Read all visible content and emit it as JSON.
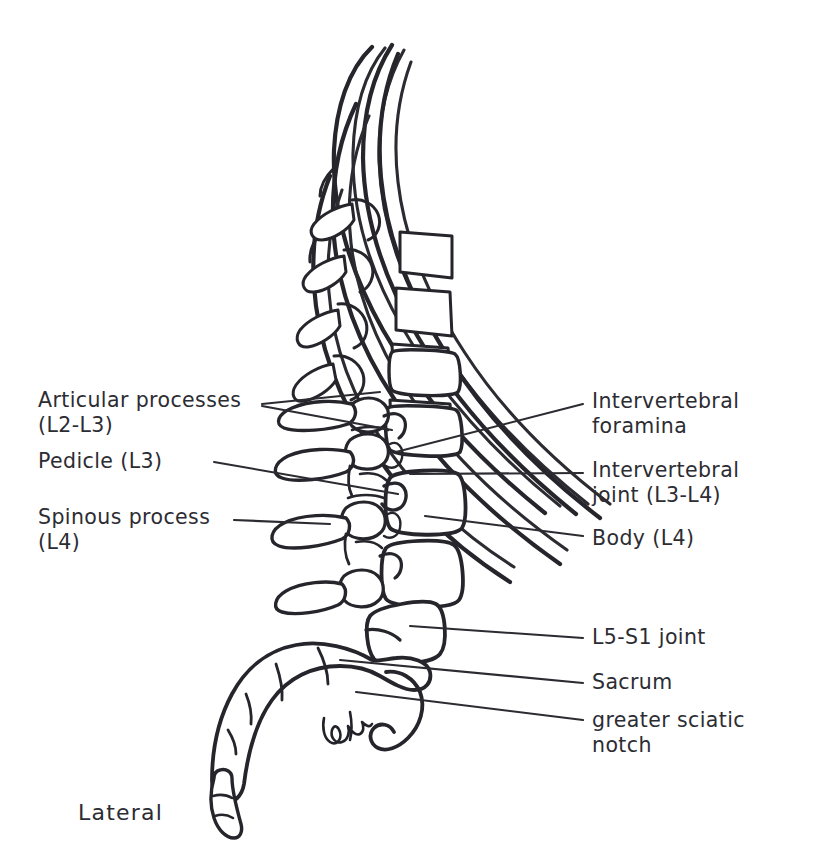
{
  "figure": {
    "caption": "Lateral",
    "ink_color": "#25252b",
    "background_color": "#ffffff"
  },
  "labels": {
    "left": [
      {
        "id": "articular-processes",
        "text": "Articular processes\n(L2-L3)",
        "x": 38,
        "y": 392
      },
      {
        "id": "pedicle",
        "text": "Pedicle (L3)",
        "x": 38,
        "y": 452
      },
      {
        "id": "spinous-process",
        "text": "Spinous process\n(L4)",
        "x": 38,
        "y": 508
      }
    ],
    "right": [
      {
        "id": "intervertebral-foramina",
        "text": "Intervertebral\nforamina",
        "x": 590,
        "y": 392
      },
      {
        "id": "intervertebral-joint",
        "text": "Intervertebral\njoint (L3-L4)",
        "x": 590,
        "y": 461
      },
      {
        "id": "body-l4",
        "text": "Body (L4)",
        "x": 590,
        "y": 530
      },
      {
        "id": "l5-s1-joint",
        "text": "L5-S1 joint",
        "x": 590,
        "y": 628
      },
      {
        "id": "sacrum",
        "text": "Sacrum",
        "x": 590,
        "y": 675
      },
      {
        "id": "greater-sciatic-notch",
        "text": "greater sciatic\nnotch",
        "x": 590,
        "y": 712
      }
    ]
  },
  "caption_position": {
    "x": 78,
    "y": 806
  },
  "structures": [
    {
      "name": "ribs",
      "count": 5,
      "description": "lower ribs sweeping from upper left to lower right"
    },
    {
      "name": "thoracic-vertebral-bodies",
      "count": 4
    },
    {
      "name": "lumbar-vertebrae",
      "count": 5,
      "labels": [
        "L1",
        "L2",
        "L3",
        "L4",
        "L5"
      ]
    },
    {
      "name": "sacrum",
      "segments": 4
    },
    {
      "name": "coccyx",
      "segments": 3
    },
    {
      "name": "greater-sciatic-notch",
      "count": 1
    },
    {
      "name": "artist-signature",
      "count": 1
    }
  ]
}
